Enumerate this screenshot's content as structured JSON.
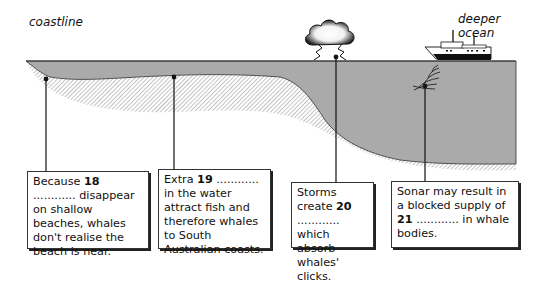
{
  "labels": {
    "left": "coastline",
    "right": "deeper ocean"
  },
  "icons": {
    "storm": "storm-cloud-lightning-icon",
    "ship": "ship-icon",
    "sonar": "sonar-waves-icon"
  },
  "colors": {
    "water": "#aaaaaa",
    "seabed_hatch": "#8a8a8a",
    "line": "#222222"
  },
  "boxes": [
    {
      "id": "18",
      "before": "Because ",
      "number": "18",
      "after": " ............ disappear on shallow beaches, whales don't realise the beach is near."
    },
    {
      "id": "19",
      "before": "Extra ",
      "number": "19",
      "after": " ............ in the water attract fish and therefore whales to South Australian coasts."
    },
    {
      "id": "20",
      "before": "Storms create ",
      "number": "20",
      "after": " ............ which absorb whales' clicks."
    },
    {
      "id": "21",
      "before": "Sonar may result in a blocked supply of ",
      "number": "21",
      "after": " ............ in whale bodies."
    }
  ]
}
